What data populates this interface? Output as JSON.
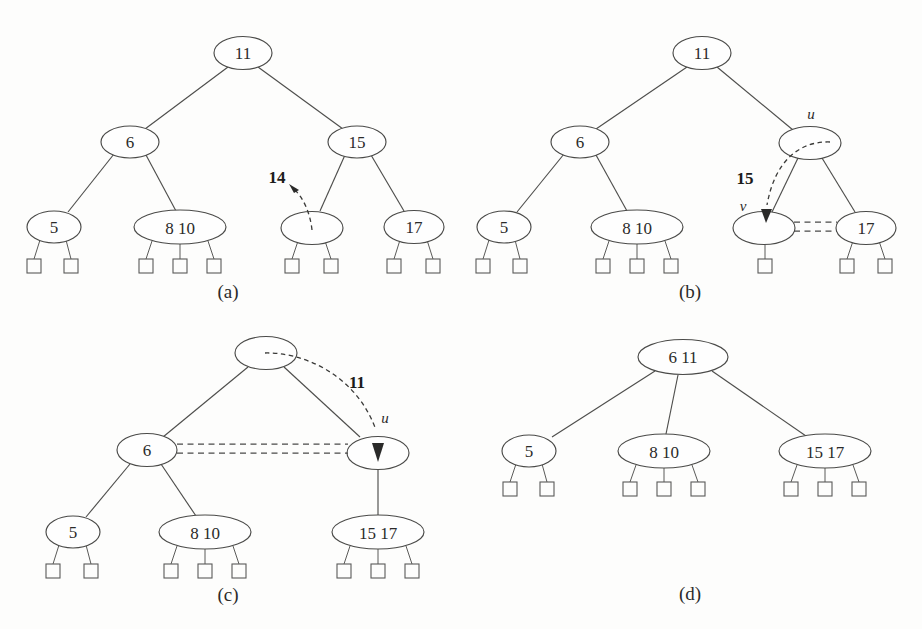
{
  "figure": {
    "background_color": "#fdfdfc",
    "ink_color": "#4a4a48",
    "panels": [
      {
        "id": "a",
        "label": "(a)",
        "caption_note": "Insert key 14 into an empty slot of a leaf node",
        "inserted_key": "14",
        "nodes": [
          {
            "name": "root",
            "keys": "11"
          },
          {
            "name": "internal-left",
            "keys": "6"
          },
          {
            "name": "internal-right",
            "keys": "15"
          },
          {
            "name": "leaf-5",
            "keys": "5"
          },
          {
            "name": "leaf-8-10",
            "keys": "8   10"
          },
          {
            "name": "leaf-empty",
            "keys": ""
          },
          {
            "name": "leaf-17",
            "keys": "17"
          }
        ]
      },
      {
        "id": "b",
        "label": "(b)",
        "caption_note": "Key 15 moves down from u into v; v and 17 merge",
        "inserted_key": "15",
        "pointer_u": "u",
        "pointer_v": "v",
        "nodes": [
          {
            "name": "root",
            "keys": "11"
          },
          {
            "name": "internal-left",
            "keys": "6"
          },
          {
            "name": "node-u",
            "keys": ""
          },
          {
            "name": "leaf-5",
            "keys": "5"
          },
          {
            "name": "leaf-8-10",
            "keys": "8   10"
          },
          {
            "name": "node-v",
            "keys": ""
          },
          {
            "name": "leaf-17",
            "keys": "17"
          }
        ]
      },
      {
        "id": "c",
        "label": "(c)",
        "caption_note": "Key 11 moves down from root into u; 6 and u merge",
        "inserted_key": "11",
        "pointer_u": "u",
        "nodes": [
          {
            "name": "root-empty",
            "keys": ""
          },
          {
            "name": "internal-6",
            "keys": "6"
          },
          {
            "name": "node-u",
            "keys": ""
          },
          {
            "name": "leaf-5",
            "keys": "5"
          },
          {
            "name": "leaf-8-10",
            "keys": "8   10"
          },
          {
            "name": "leaf-15-17",
            "keys": "15  17"
          }
        ]
      },
      {
        "id": "d",
        "label": "(d)",
        "caption_note": "Resulting tree after the merges",
        "nodes": [
          {
            "name": "root",
            "keys": "6   11"
          },
          {
            "name": "leaf-5",
            "keys": "5"
          },
          {
            "name": "leaf-8-10",
            "keys": "8   10"
          },
          {
            "name": "leaf-15-17",
            "keys": "15  17"
          }
        ]
      }
    ]
  }
}
